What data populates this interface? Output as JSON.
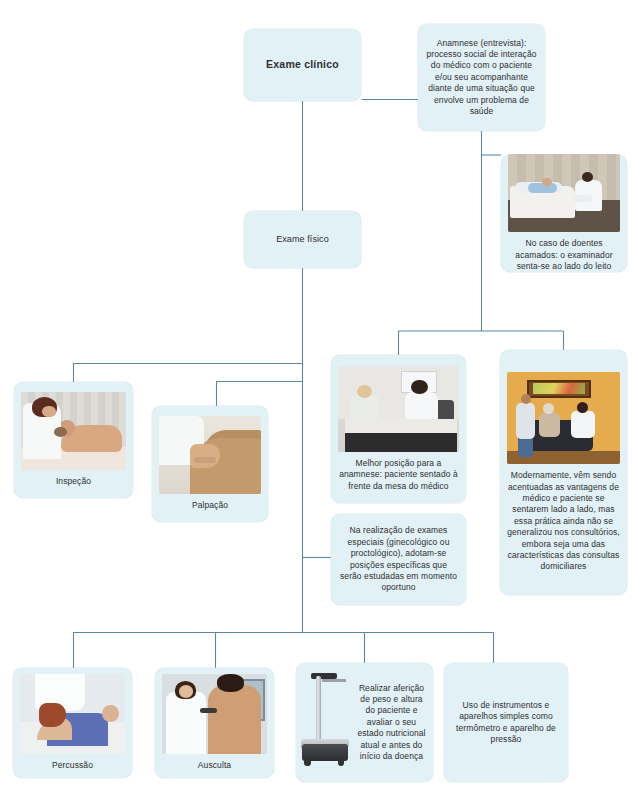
{
  "diagram": {
    "title": "Exame clínico",
    "language": "pt-BR",
    "accent_color": "#4a7fa0",
    "node_fill_color": "#e1f1f6",
    "text_color": "#2f2f2f"
  },
  "nodes": {
    "exame_clinico": {
      "label": "Exame clínico",
      "image_alt": ""
    },
    "anamnese": {
      "label": "Anamnese (entrevista): processo social de interação do médico com o paciente e/ou seu acompanhante diante de uma situação que envolve um problema de saúde",
      "image_alt": ""
    },
    "acamados": {
      "label": "No caso de doentes acamados: o examinador senta-se ao lado do leito",
      "image_alt": "photo-bedridden-patient-examiner"
    },
    "exame_fisico": {
      "label": "Exame físico",
      "image_alt": ""
    },
    "inspecao": {
      "label": "Inspeção",
      "image_alt": "photo-doctor-inspecting-patient"
    },
    "palpacao": {
      "label": "Palpação",
      "image_alt": "photo-hands-palpating-abdomen"
    },
    "melhor_posicao": {
      "label": "Melhor posição para a anamnese: paciente sentado à frente da mesa do médico",
      "image_alt": "photo-patient-seated-facing-desk"
    },
    "modernamente": {
      "label": "Modernamente, vêm sendo acentuadas as vantagens de médico e paciente se sentarem lado a lado, mas essa prática ainda não se generalizou nos consultórios, embora seja uma das características das consultas domiciliares",
      "image_alt": "photo-home-consultation-side-by-side"
    },
    "exames_especiais": {
      "label": "Na realização de exames especiais (ginecológico ou proctológico), adotam-se posições específicas que serão estudadas em momento oportuno",
      "image_alt": ""
    },
    "percussao": {
      "label": "Percussão",
      "image_alt": "photo-percussion-abdomen"
    },
    "ausculta": {
      "label": "Ausculta",
      "image_alt": "photo-auscultation-back-stethoscope"
    },
    "afericao": {
      "label": "Realizar aferição de peso e altura do paciente e avaliar o seu estado nutricional atual e antes do início da doença",
      "image_alt": "photo-weighing-scale-with-stadiometer"
    },
    "instrumentos": {
      "label": "Uso de instrumentos e aparelhos simples como termômetro e aparelho de pressão",
      "image_alt": ""
    }
  },
  "connections": [
    {
      "from": "exame_clinico",
      "to": "anamnese"
    },
    {
      "from": "exame_clinico",
      "to": "exame_fisico"
    },
    {
      "from": "anamnese",
      "to": "acamados"
    },
    {
      "from": "anamnese",
      "to": "melhor_posicao"
    },
    {
      "from": "anamnese",
      "to": "modernamente"
    },
    {
      "from": "exame_fisico",
      "to": "inspecao"
    },
    {
      "from": "exame_fisico",
      "to": "palpacao"
    },
    {
      "from": "exame_fisico",
      "to": "exames_especiais"
    },
    {
      "from": "exame_fisico",
      "to": "percussao"
    },
    {
      "from": "exame_fisico",
      "to": "ausculta"
    },
    {
      "from": "exame_fisico",
      "to": "afericao"
    },
    {
      "from": "exame_fisico",
      "to": "instrumentos"
    }
  ]
}
